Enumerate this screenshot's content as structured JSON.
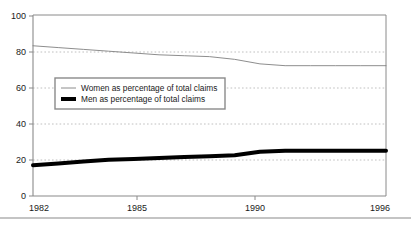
{
  "chart_data": {
    "type": "line",
    "title": "",
    "subtitle": "",
    "xlabel": "",
    "ylabel": "",
    "xlim": [
      1982,
      1996
    ],
    "ylim": [
      0,
      100
    ],
    "grid": "horizontal-dotted",
    "legend_position": "inside-upper-left",
    "x": [
      1982,
      1983,
      1984,
      1985,
      1986,
      1987,
      1988,
      1989,
      1990,
      1991,
      1992,
      1993,
      1994,
      1995,
      1996
    ],
    "y_ticks": [
      0,
      20,
      40,
      60,
      80,
      100
    ],
    "y_tick_labels": [
      "0",
      "20",
      "40",
      "60",
      "80",
      "100"
    ],
    "x_ticks": [
      1982,
      1985,
      1990,
      1996
    ],
    "x_tick_labels": [
      "1982",
      "1985",
      "1990",
      "1996"
    ],
    "series": [
      {
        "name": "Women as percentage of total claims",
        "style": "thin",
        "color": "#808080",
        "values": [
          83,
          82,
          81,
          80,
          79,
          78,
          77.5,
          77,
          75.5,
          73,
          72,
          72,
          72,
          72,
          72
        ]
      },
      {
        "name": "Men as percentage of total claims",
        "style": "thick",
        "color": "#000000",
        "values": [
          17,
          18,
          19,
          20,
          20.5,
          21,
          21.5,
          22,
          22.5,
          24.5,
          25,
          25,
          25,
          25,
          25
        ]
      }
    ]
  },
  "legend": {
    "items": [
      {
        "label": "Women as percentage of total claims",
        "marker": "thin-line-swatch"
      },
      {
        "label": "Men as percentage of total claims",
        "marker": "thick-line-swatch"
      }
    ]
  },
  "colors": {
    "women_line": "#808080",
    "men_line": "#000000",
    "axis": "#808080",
    "gridline": "#b0b0b0",
    "legend_border": "#808080",
    "footer_rule": "#808080",
    "text": "#1a1a1a",
    "background": "#ffffff"
  }
}
